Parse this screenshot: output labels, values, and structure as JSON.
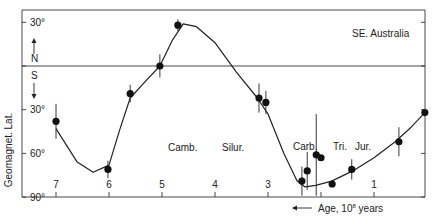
{
  "chart_data": {
    "type": "line",
    "title": "",
    "region_label": "SE. Australia",
    "xlabel": "Age, 10^8 years",
    "xlabel_display": "Age, 10",
    "xlabel_exp": "8",
    "xlabel_suffix": " years",
    "ylabel": "Geomagnet. Lat.",
    "xlim": [
      7.6,
      0
    ],
    "ylim": [
      -90,
      40
    ],
    "x_ticks": [
      7,
      6,
      5,
      4,
      3,
      2,
      1
    ],
    "x_tick_labels": [
      "7",
      "6",
      "5",
      "4",
      "3",
      "",
      "1"
    ],
    "y_ticks": [
      30,
      0,
      -30,
      -60,
      -90
    ],
    "y_tick_labels": [
      "30°",
      "",
      "30°",
      "60°",
      "90°"
    ],
    "hemisphere_labels": {
      "north": "N",
      "south": "S"
    },
    "period_labels": [
      "Camb.",
      "Silur.",
      "Carb.",
      "Tri.",
      "Jur."
    ],
    "grid": false,
    "reference_line": {
      "y": 0,
      "label": "equator"
    },
    "series": [
      {
        "name": "Paleomagnetic poles (points with error bars)",
        "points": [
          {
            "age": 7.0,
            "lat": -38,
            "err": 12
          },
          {
            "age": 6.02,
            "lat": -71,
            "err": 6
          },
          {
            "age": 5.6,
            "lat": -19,
            "err": 6
          },
          {
            "age": 5.04,
            "lat": 0,
            "err": 8
          },
          {
            "age": 4.7,
            "lat": 28,
            "err": 4
          },
          {
            "age": 3.17,
            "lat": -22,
            "err": 10
          },
          {
            "age": 3.04,
            "lat": -25,
            "err": 8
          },
          {
            "age": 2.36,
            "lat": -79,
            "err": 10
          },
          {
            "age": 2.26,
            "lat": -72,
            "err": 13
          },
          {
            "age": 2.09,
            "lat": -61,
            "err": 28
          },
          {
            "age": 2.0,
            "lat": -63,
            "err": 0
          },
          {
            "age": 1.79,
            "lat": -81,
            "err": 0
          },
          {
            "age": 1.42,
            "lat": -71,
            "err": 7
          },
          {
            "age": 0.53,
            "lat": -52,
            "err": 10
          },
          {
            "age": 0.04,
            "lat": -32,
            "err": 0
          }
        ]
      },
      {
        "name": "Fitted curve",
        "x": [
          7.0,
          6.6,
          6.3,
          6.0,
          5.8,
          5.6,
          5.3,
          5.04,
          4.8,
          4.6,
          4.35,
          4.0,
          3.6,
          3.2,
          3.0,
          2.7,
          2.45,
          2.3,
          2.1,
          1.8,
          1.4,
          1.0,
          0.6,
          0.3,
          0.04
        ],
        "y": [
          -43,
          -66,
          -73,
          -68,
          -44,
          -22,
          -10,
          0,
          18,
          29,
          27,
          16,
          -4,
          -22,
          -33,
          -60,
          -79,
          -83,
          -82,
          -79,
          -72,
          -63,
          -52,
          -42,
          -32
        ]
      }
    ]
  }
}
